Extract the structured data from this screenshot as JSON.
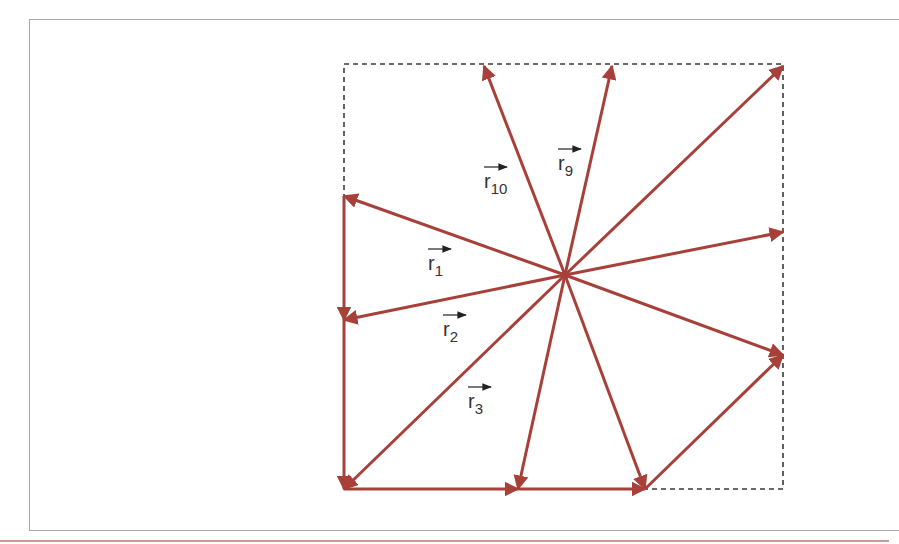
{
  "diagram": {
    "type": "vector-star",
    "colors": {
      "vector": "#a8403a",
      "dashed_box": "#3a3a3a",
      "label": "#333333",
      "frame": "#a8a8a8",
      "footer_rule": "#c99a98"
    },
    "origin": {
      "x": 565,
      "y": 275
    },
    "box": {
      "x1": 344,
      "y1": 64,
      "x2": 783,
      "y2": 489
    },
    "radial_vectors": [
      {
        "id": "r1",
        "to": {
          "x": 344,
          "y": 196
        }
      },
      {
        "id": "r2",
        "to": {
          "x": 344,
          "y": 320
        }
      },
      {
        "id": "r3",
        "to": {
          "x": 344,
          "y": 489
        }
      },
      {
        "id": "r4",
        "to": {
          "x": 518,
          "y": 489
        }
      },
      {
        "id": "r5",
        "to": {
          "x": 645,
          "y": 489
        }
      },
      {
        "id": "r6",
        "to": {
          "x": 783,
          "y": 355
        }
      },
      {
        "id": "r7",
        "to": {
          "x": 783,
          "y": 232
        }
      },
      {
        "id": "r8",
        "to": {
          "x": 783,
          "y": 66
        }
      },
      {
        "id": "r9",
        "to": {
          "x": 612,
          "y": 66
        }
      },
      {
        "id": "r10",
        "to": {
          "x": 484,
          "y": 66
        }
      }
    ],
    "path_vectors": [
      {
        "from": {
          "x": 344,
          "y": 196
        },
        "to": {
          "x": 344,
          "y": 320
        }
      },
      {
        "from": {
          "x": 344,
          "y": 320
        },
        "to": {
          "x": 344,
          "y": 489
        }
      },
      {
        "from": {
          "x": 344,
          "y": 489
        },
        "to": {
          "x": 518,
          "y": 489
        }
      },
      {
        "from": {
          "x": 518,
          "y": 489
        },
        "to": {
          "x": 645,
          "y": 489
        }
      },
      {
        "from": {
          "x": 645,
          "y": 489
        },
        "to": {
          "x": 783,
          "y": 355
        }
      }
    ],
    "labels": [
      {
        "base": "r",
        "sub": "1",
        "x": 428,
        "y": 270
      },
      {
        "base": "r",
        "sub": "2",
        "x": 443,
        "y": 336
      },
      {
        "base": "r",
        "sub": "3",
        "x": 468,
        "y": 408
      },
      {
        "base": "r",
        "sub": "9",
        "x": 558,
        "y": 170
      },
      {
        "base": "r",
        "sub": "10",
        "x": 484,
        "y": 188
      }
    ]
  }
}
